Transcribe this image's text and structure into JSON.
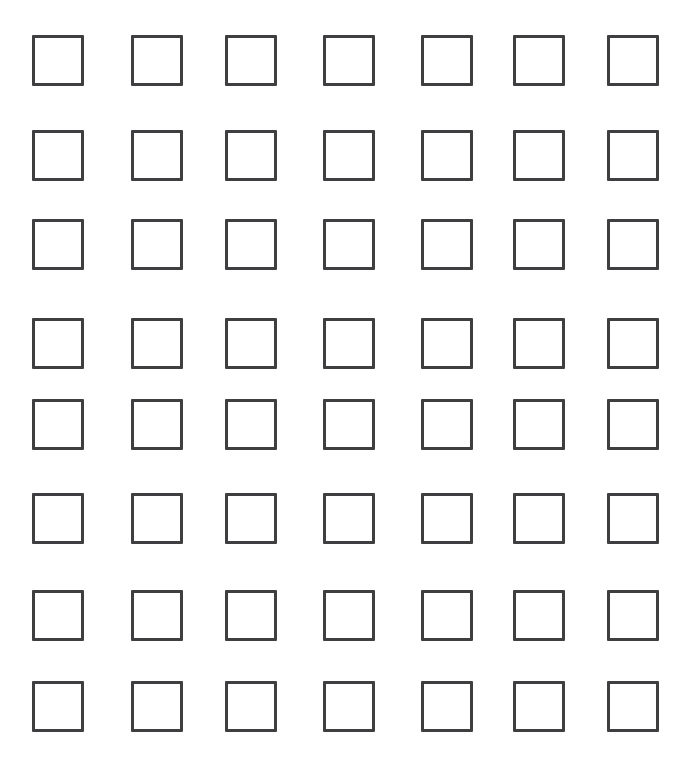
{
  "page": {
    "background_color": "#ffffff",
    "width": 691,
    "height": 759
  },
  "grid": {
    "columns": 7,
    "rows": 8,
    "total_checkboxes": 56,
    "checkbox": {
      "state": "unchecked",
      "width": 52,
      "height": 51,
      "border_width": 3,
      "border_color": "#3f3f41",
      "fill_color": "#ffffff"
    },
    "column_x": [
      32,
      131,
      225,
      323,
      421,
      513,
      607
    ],
    "row_y": [
      35,
      130,
      219,
      318,
      399,
      493,
      590,
      681
    ],
    "items": [
      {
        "row": 1,
        "cells": [
          {
            "name": "checkbox-r1c1",
            "state": "unchecked"
          },
          {
            "name": "checkbox-r1c2",
            "state": "unchecked"
          },
          {
            "name": "checkbox-r1c3",
            "state": "unchecked"
          },
          {
            "name": "checkbox-r1c4",
            "state": "unchecked"
          },
          {
            "name": "checkbox-r1c5",
            "state": "unchecked"
          },
          {
            "name": "checkbox-r1c6",
            "state": "unchecked"
          },
          {
            "name": "checkbox-r1c7",
            "state": "unchecked"
          }
        ]
      },
      {
        "row": 2,
        "cells": [
          {
            "name": "checkbox-r2c1",
            "state": "unchecked"
          },
          {
            "name": "checkbox-r2c2",
            "state": "unchecked"
          },
          {
            "name": "checkbox-r2c3",
            "state": "unchecked"
          },
          {
            "name": "checkbox-r2c4",
            "state": "unchecked"
          },
          {
            "name": "checkbox-r2c5",
            "state": "unchecked"
          },
          {
            "name": "checkbox-r2c6",
            "state": "unchecked"
          },
          {
            "name": "checkbox-r2c7",
            "state": "unchecked"
          }
        ]
      },
      {
        "row": 3,
        "cells": [
          {
            "name": "checkbox-r3c1",
            "state": "unchecked"
          },
          {
            "name": "checkbox-r3c2",
            "state": "unchecked"
          },
          {
            "name": "checkbox-r3c3",
            "state": "unchecked"
          },
          {
            "name": "checkbox-r3c4",
            "state": "unchecked"
          },
          {
            "name": "checkbox-r3c5",
            "state": "unchecked"
          },
          {
            "name": "checkbox-r3c6",
            "state": "unchecked"
          },
          {
            "name": "checkbox-r3c7",
            "state": "unchecked"
          }
        ]
      },
      {
        "row": 4,
        "cells": [
          {
            "name": "checkbox-r4c1",
            "state": "unchecked"
          },
          {
            "name": "checkbox-r4c2",
            "state": "unchecked"
          },
          {
            "name": "checkbox-r4c3",
            "state": "unchecked"
          },
          {
            "name": "checkbox-r4c4",
            "state": "unchecked"
          },
          {
            "name": "checkbox-r4c5",
            "state": "unchecked"
          },
          {
            "name": "checkbox-r4c6",
            "state": "unchecked"
          },
          {
            "name": "checkbox-r4c7",
            "state": "unchecked"
          }
        ]
      },
      {
        "row": 5,
        "cells": [
          {
            "name": "checkbox-r5c1",
            "state": "unchecked"
          },
          {
            "name": "checkbox-r5c2",
            "state": "unchecked"
          },
          {
            "name": "checkbox-r5c3",
            "state": "unchecked"
          },
          {
            "name": "checkbox-r5c4",
            "state": "unchecked"
          },
          {
            "name": "checkbox-r5c5",
            "state": "unchecked"
          },
          {
            "name": "checkbox-r5c6",
            "state": "unchecked"
          },
          {
            "name": "checkbox-r5c7",
            "state": "unchecked"
          }
        ]
      },
      {
        "row": 6,
        "cells": [
          {
            "name": "checkbox-r6c1",
            "state": "unchecked"
          },
          {
            "name": "checkbox-r6c2",
            "state": "unchecked"
          },
          {
            "name": "checkbox-r6c3",
            "state": "unchecked"
          },
          {
            "name": "checkbox-r6c4",
            "state": "unchecked"
          },
          {
            "name": "checkbox-r6c5",
            "state": "unchecked"
          },
          {
            "name": "checkbox-r6c6",
            "state": "unchecked"
          },
          {
            "name": "checkbox-r6c7",
            "state": "unchecked"
          }
        ]
      },
      {
        "row": 7,
        "cells": [
          {
            "name": "checkbox-r7c1",
            "state": "unchecked"
          },
          {
            "name": "checkbox-r7c2",
            "state": "unchecked"
          },
          {
            "name": "checkbox-r7c3",
            "state": "unchecked"
          },
          {
            "name": "checkbox-r7c4",
            "state": "unchecked"
          },
          {
            "name": "checkbox-r7c5",
            "state": "unchecked"
          },
          {
            "name": "checkbox-r7c6",
            "state": "unchecked"
          },
          {
            "name": "checkbox-r7c7",
            "state": "unchecked"
          }
        ]
      },
      {
        "row": 8,
        "cells": [
          {
            "name": "checkbox-r8c1",
            "state": "unchecked"
          },
          {
            "name": "checkbox-r8c2",
            "state": "unchecked"
          },
          {
            "name": "checkbox-r8c3",
            "state": "unchecked"
          },
          {
            "name": "checkbox-r8c4",
            "state": "unchecked"
          },
          {
            "name": "checkbox-r8c5",
            "state": "unchecked"
          },
          {
            "name": "checkbox-r8c6",
            "state": "unchecked"
          },
          {
            "name": "checkbox-r8c7",
            "state": "unchecked"
          }
        ]
      }
    ]
  },
  "footer": {
    "faint_text": ""
  }
}
